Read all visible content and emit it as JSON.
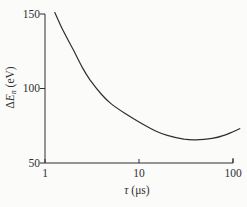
{
  "figure": {
    "background": "#fbfbfa",
    "ink_color": "#2f2f2f"
  },
  "chart_data": {
    "type": "line",
    "title": "",
    "xlabel": {
      "symbol": "τ",
      "unit": "(μs)"
    },
    "ylabel": {
      "prefix": "Δ",
      "symbol": "E",
      "subscript": "n",
      "unit": "(eV)"
    },
    "x_scale": "log",
    "y_scale": "linear",
    "xlim": [
      1,
      100
    ],
    "ylim": [
      50,
      150
    ],
    "x_ticks": [
      1,
      10,
      100
    ],
    "y_ticks": [
      50,
      100,
      150
    ],
    "grid": false,
    "legend": false,
    "series": [
      {
        "name": "energy-spread-vs-tau",
        "x": [
          1.27,
          1.5,
          2,
          2.5,
          3,
          4,
          5,
          7,
          10,
          15,
          20,
          30,
          40,
          60,
          80,
          100,
          118
        ],
        "y": [
          151,
          141,
          126,
          114,
          106,
          96,
          90,
          83.5,
          77.5,
          71.5,
          68.5,
          66,
          65.5,
          66.5,
          68.5,
          71,
          73
        ]
      }
    ]
  }
}
